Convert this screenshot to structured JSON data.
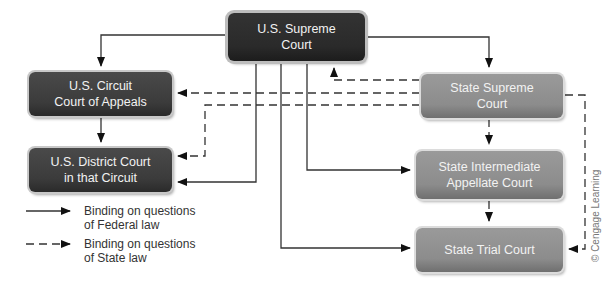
{
  "diagram": {
    "nodes": {
      "us_supreme": {
        "label_line1": "U.S. Supreme",
        "label_line2": "Court",
        "tier": "federal"
      },
      "us_circuit": {
        "label_line1": "U.S. Circuit",
        "label_line2": "Court of Appeals",
        "tier": "federal"
      },
      "us_district": {
        "label_line1": "U.S. District Court",
        "label_line2": "in that Circuit",
        "tier": "federal"
      },
      "state_supreme": {
        "label_line1": "State Supreme",
        "label_line2": "Court",
        "tier": "state"
      },
      "state_intermediate": {
        "label_line1": "State Intermediate",
        "label_line2": "Appellate Court",
        "tier": "state"
      },
      "state_trial": {
        "label_line1": "State Trial Court",
        "tier": "state"
      }
    },
    "edges": [
      {
        "from": "us_supreme",
        "to": "us_circuit",
        "style": "solid"
      },
      {
        "from": "us_supreme",
        "to": "us_district",
        "style": "solid"
      },
      {
        "from": "us_supreme",
        "to": "state_supreme",
        "style": "solid"
      },
      {
        "from": "us_supreme",
        "to": "state_intermediate",
        "style": "solid"
      },
      {
        "from": "us_supreme",
        "to": "state_trial",
        "style": "solid"
      },
      {
        "from": "us_circuit",
        "to": "us_district",
        "style": "solid"
      },
      {
        "from": "state_supreme",
        "to": "us_supreme",
        "style": "dashed"
      },
      {
        "from": "state_supreme",
        "to": "us_circuit",
        "style": "dashed"
      },
      {
        "from": "state_supreme",
        "to": "us_district",
        "style": "dashed"
      },
      {
        "from": "state_supreme",
        "to": "state_intermediate",
        "style": "dashed"
      },
      {
        "from": "state_supreme",
        "to": "state_trial",
        "style": "dashed"
      },
      {
        "from": "state_intermediate",
        "to": "state_trial",
        "style": "dashed"
      }
    ],
    "legend": [
      {
        "style": "solid",
        "line1": "Binding on questions",
        "line2": "of Federal law"
      },
      {
        "style": "dashed",
        "line1": "Binding on questions",
        "line2": "of State law"
      }
    ],
    "credit": "© Cengage Learning",
    "colors": {
      "federal_box": "#3b3b3b",
      "state_box": "#8c8c8c",
      "line": "#222222",
      "text": "#f2f2f2"
    }
  }
}
